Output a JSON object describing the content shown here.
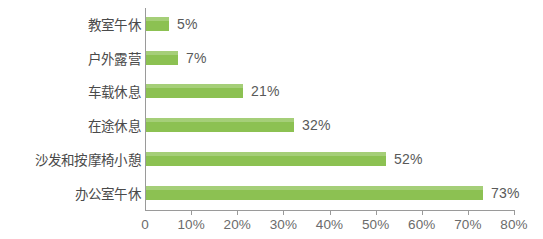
{
  "chart_data": {
    "type": "bar",
    "orientation": "horizontal",
    "title": "",
    "subtitle": "",
    "xlabel": "",
    "ylabel": "",
    "categories": [
      "教室午休",
      "户外露营",
      "车载休息",
      "在途休息",
      "沙发和按摩椅小憩",
      "办公室午休"
    ],
    "values": [
      5,
      7,
      21,
      32,
      52,
      73
    ],
    "value_labels": [
      "5%",
      "7%",
      "21%",
      "32%",
      "52%",
      "73%"
    ],
    "xlim": [
      0,
      80
    ],
    "xticks": [
      0,
      10,
      20,
      30,
      40,
      50,
      60,
      70,
      80
    ],
    "xtick_labels": [
      "0",
      "10%",
      "20%",
      "30%",
      "40%",
      "50%",
      "60%",
      "70%",
      "80%"
    ],
    "grid": false,
    "legend": null,
    "bar_color": "#8cc152",
    "axis_color": "#9a9a9a",
    "label_color": "#4a4a4a",
    "value_label_color": "#595959",
    "background": "#ffffff"
  }
}
